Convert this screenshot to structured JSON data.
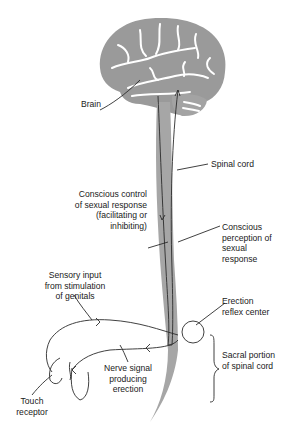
{
  "diagram": {
    "type": "anatomical-pathway",
    "colors": {
      "tissue": "#9a9a9a",
      "line": "#2b2b2b",
      "text": "#1a1a1a",
      "background": "#ffffff"
    },
    "labels": {
      "brain": "Brain",
      "spinal_cord": "Spinal cord",
      "conscious_control": "Conscious control\nof sexual response\n(facilitating or\ninhibiting)",
      "conscious_perception": "Conscious\nperception of\nsexual\nresponse",
      "sensory_input": "Sensory input\nfrom stimulation\nof genitals",
      "erection_reflex_center": "Erection\nreflex center",
      "sacral_portion": "Sacral portion\nof spinal cord",
      "nerve_signal": "Nerve signal\nproducing\nerection",
      "touch_receptor": "Touch\nreceptor"
    }
  }
}
